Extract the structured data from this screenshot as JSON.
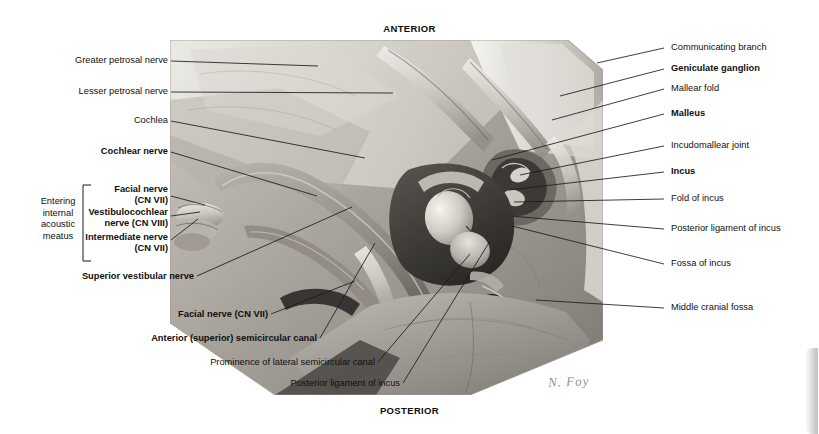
{
  "figure": {
    "orientation": {
      "top": "ANTERIOR",
      "bottom": "POSTERIOR"
    },
    "signature": "N. Foy",
    "brace": {
      "text": "Entering\ninternal\nacoustic\nmeatus"
    },
    "labels_left": [
      {
        "text": "Greater petrosal nerve",
        "bold": false
      },
      {
        "text": "Lesser petrosal nerve",
        "bold": false
      },
      {
        "text": "Cochlea",
        "bold": false
      },
      {
        "text": "Cochlear nerve",
        "bold": true
      },
      {
        "text": "Facial nerve\n(CN VII)",
        "bold": true
      },
      {
        "text": "Vestibulocochlear\nnerve (CN VIII)",
        "bold": true
      },
      {
        "text": "Intermediate nerve\n(CN VII)",
        "bold": true
      },
      {
        "text": "Superior vestibular nerve",
        "bold": true
      },
      {
        "text": "Facial nerve (CN VII)",
        "bold": true
      },
      {
        "text": "Anterior (superior) semicircular canal",
        "bold": true
      },
      {
        "text": "Prominence of lateral semicircular canal",
        "bold": false
      },
      {
        "text": "Posterior ligament of incus",
        "bold": false
      }
    ],
    "labels_right": [
      {
        "text": "Communicating branch",
        "bold": false
      },
      {
        "text": "Geniculate ganglion",
        "bold": true
      },
      {
        "text": "Mallear fold",
        "bold": false
      },
      {
        "text": "Malleus",
        "bold": true
      },
      {
        "text": "Incudomallear joint",
        "bold": false
      },
      {
        "text": "Incus",
        "bold": true
      },
      {
        "text": "Fold of incus",
        "bold": false
      },
      {
        "text": "Posterior ligament of incus",
        "bold": false
      },
      {
        "text": "Fossa of incus",
        "bold": false
      },
      {
        "text": "Middle cranial fossa",
        "bold": false
      }
    ]
  },
  "colors": {
    "background": "#ffffff",
    "text": "#101010",
    "leader_line": "#1b1b1b",
    "scrollbar_thumb": "#c2c2c2"
  }
}
